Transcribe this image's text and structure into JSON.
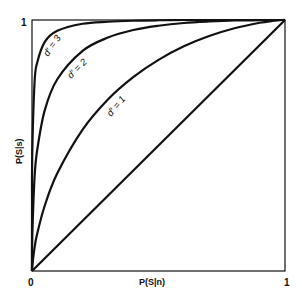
{
  "chart_data": {
    "type": "line",
    "title": "",
    "xlabel": "P(S|n)",
    "ylabel": "P(S|s)",
    "xlim": [
      0,
      1
    ],
    "ylim": [
      0,
      1
    ],
    "grid": false,
    "legend": "none (curves labelled inline)",
    "x_ticks": [
      "0",
      "1"
    ],
    "y_ticks": [
      "0",
      "1"
    ],
    "series": [
      {
        "name": "d' = 3",
        "label": "d' = 3",
        "x": [
          0,
          0.0001,
          0.001,
          0.01,
          0.02,
          0.05,
          0.1,
          0.2,
          0.3,
          0.4,
          0.5,
          0.6,
          0.7,
          0.8,
          0.9,
          1
        ],
        "y": [
          0,
          0.236,
          0.464,
          0.75,
          0.828,
          0.912,
          0.957,
          0.985,
          0.993,
          0.997,
          0.999,
          1.0,
          1.0,
          1.0,
          1.0,
          1
        ]
      },
      {
        "name": "d' = 2",
        "label": "d' = 2",
        "x": [
          0,
          0.0001,
          0.001,
          0.01,
          0.02,
          0.05,
          0.1,
          0.2,
          0.3,
          0.4,
          0.5,
          0.6,
          0.7,
          0.8,
          0.9,
          0.95,
          1
        ],
        "y": [
          0,
          0.043,
          0.138,
          0.372,
          0.478,
          0.639,
          0.764,
          0.877,
          0.93,
          0.96,
          0.977,
          0.988,
          0.994,
          0.998,
          0.999,
          1.0,
          1
        ]
      },
      {
        "name": "d' = 1",
        "label": "d' = 1",
        "x": [
          0,
          0.001,
          0.01,
          0.02,
          0.05,
          0.1,
          0.2,
          0.3,
          0.4,
          0.5,
          0.6,
          0.7,
          0.8,
          0.9,
          0.95,
          0.99,
          1
        ],
        "y": [
          0,
          0.018,
          0.092,
          0.146,
          0.259,
          0.389,
          0.563,
          0.683,
          0.772,
          0.841,
          0.895,
          0.936,
          0.967,
          0.989,
          0.996,
          1.0,
          1
        ]
      },
      {
        "name": "chance (d' = 0)",
        "label": "",
        "x": [
          0,
          1
        ],
        "y": [
          0,
          1
        ]
      }
    ],
    "annotations": [
      {
        "text": "d' = 3",
        "x": 0.1,
        "y": 0.86,
        "rotation": -55
      },
      {
        "text": "d' = 2",
        "x": 0.26,
        "y": 0.76,
        "rotation": -45
      },
      {
        "text": "d' = 1",
        "x": 0.33,
        "y": 0.53,
        "rotation": -50
      }
    ]
  },
  "axes": {
    "x_label": "P(S|n)",
    "y_label": "P(S|s)",
    "x_tick_0": "0",
    "x_tick_1": "1",
    "y_tick_1": "1"
  },
  "labels": {
    "d3": "d′ = 3",
    "d2": "d′ = 2",
    "d1": "d′ = 1"
  }
}
